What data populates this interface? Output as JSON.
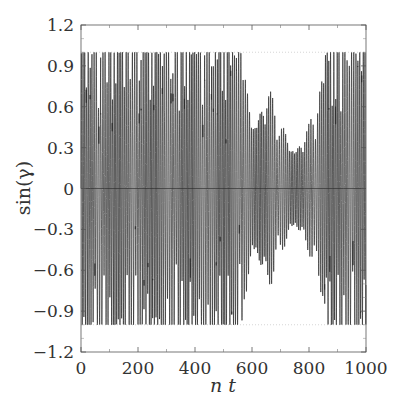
{
  "chart_data": {
    "type": "line",
    "title": "",
    "xlabel": "n t",
    "ylabel": "sin(γ)",
    "xlim": [
      0,
      1000
    ],
    "ylim": [
      -1.2,
      1.2
    ],
    "x_ticks": [
      0,
      200,
      400,
      600,
      800,
      1000
    ],
    "x_tick_labels": [
      "0",
      "200",
      "400",
      "600",
      "800",
      "1000"
    ],
    "x_minor_ticks": [
      100,
      300,
      500,
      700,
      900
    ],
    "y_ticks": [
      -1.2,
      -0.9,
      -0.6,
      -0.3,
      0,
      0.3,
      0.6,
      0.9,
      1.2
    ],
    "y_tick_labels": [
      "−1.2",
      "−0.9",
      "−0.6",
      "−0.3",
      "0",
      "0.3",
      "0.6",
      "0.9",
      "1.2"
    ],
    "reference_lines": [
      {
        "y": 0,
        "style": "solid"
      },
      {
        "y": 1,
        "style": "dotted"
      },
      {
        "y": -1,
        "style": "dotted"
      }
    ],
    "grid": false,
    "legend": null,
    "series": [
      {
        "name": "sin(γ)",
        "description": "Rapidly oscillating signal between -1 and 1; full-amplitude oscillations for nt 0-560 and 850-1000, reduced-amplitude dense oscillations (approx ±0.5) around nt 580-830",
        "envelope": [
          {
            "x": 0,
            "amp": 1.0
          },
          {
            "x": 100,
            "amp": 1.0
          },
          {
            "x": 200,
            "amp": 1.0
          },
          {
            "x": 300,
            "amp": 1.0
          },
          {
            "x": 400,
            "amp": 1.0
          },
          {
            "x": 500,
            "amp": 1.0
          },
          {
            "x": 560,
            "amp": 1.0
          },
          {
            "x": 600,
            "amp": 0.75
          },
          {
            "x": 650,
            "amp": 0.85
          },
          {
            "x": 700,
            "amp": 0.5
          },
          {
            "x": 750,
            "amp": 0.45
          },
          {
            "x": 800,
            "amp": 0.5
          },
          {
            "x": 830,
            "amp": 0.7
          },
          {
            "x": 860,
            "amp": 1.0
          },
          {
            "x": 1000,
            "amp": 1.0
          }
        ],
        "peak_count_approx": 150,
        "color": "#2a2a2a"
      }
    ]
  },
  "plot": {
    "frame_color": "#555555",
    "line_color": "#2a2a2a"
  }
}
